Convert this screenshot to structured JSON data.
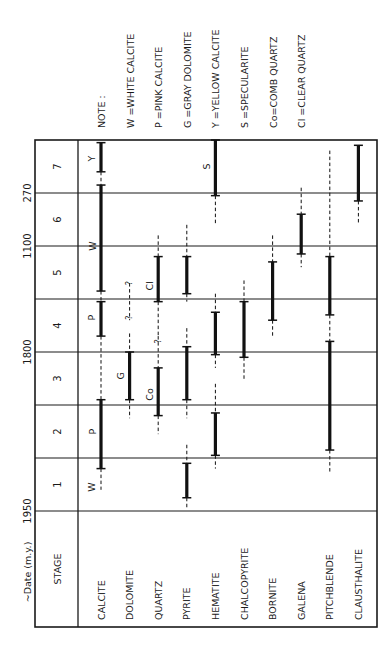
{
  "title_axis": "~Date (m.y.)",
  "stage_header": "STAGE",
  "stages": [
    "1",
    "2",
    "3",
    "4",
    "5",
    "6",
    "7"
  ],
  "date_ticks": [
    {
      "label": "1950",
      "at_stage_boundary": 0
    },
    {
      "label": "1800",
      "at_stage_boundary": 3
    },
    {
      "label": "1100",
      "at_stage_boundary": 5
    },
    {
      "label": "270",
      "at_stage_boundary": 6
    }
  ],
  "note": {
    "title": "NOTE :",
    "items": [
      "W =WHITE  CALCITE",
      "P  =PINK  CALCITE",
      "G =GRAY  DOLOMITE",
      "Y  =YELLOW CALCITE",
      "S  =SPECULARITE",
      "Co=COMB  QUARTZ",
      "Cl =CLEAR  QUARTZ"
    ]
  },
  "minerals": [
    {
      "name": "CALCITE",
      "segments": [
        {
          "type": "dashed",
          "from": 0.4,
          "to": 0.8,
          "query": true
        },
        {
          "type": "solid",
          "from": 0.8,
          "to": 2.1
        },
        {
          "type": "dashed",
          "from": 2.1,
          "to": 3.3,
          "query": true
        },
        {
          "type": "solid",
          "from": 3.3,
          "to": 3.95
        },
        {
          "type": "dashed",
          "from": 3.95,
          "to": 4.15
        },
        {
          "type": "solid",
          "from": 4.15,
          "to": 6.15
        },
        {
          "type": "dashed",
          "from": 6.15,
          "to": 6.4
        },
        {
          "type": "solid",
          "from": 6.4,
          "to": 6.95
        }
      ],
      "labels": [
        {
          "text": "W",
          "at": 0.45
        },
        {
          "text": "P",
          "at": 1.5
        },
        {
          "text": "P",
          "at": 3.65
        },
        {
          "text": "W",
          "at": 5.0
        },
        {
          "text": "Y",
          "at": 6.65
        }
      ]
    },
    {
      "name": "DOLOMITE",
      "segments": [
        {
          "type": "dashed",
          "from": 1.75,
          "to": 2.1
        },
        {
          "type": "solid",
          "from": 2.1,
          "to": 3.0
        },
        {
          "type": "dashed",
          "from": 3.0,
          "to": 3.35
        },
        {
          "type": "dashed",
          "from": 3.6,
          "to": 4.3,
          "query": true
        }
      ],
      "labels": [
        {
          "text": "G",
          "at": 2.55
        },
        {
          "text": "?",
          "at": 3.65
        },
        {
          "text": "?",
          "at": 4.3
        }
      ]
    },
    {
      "name": "QUARTZ",
      "segments": [
        {
          "type": "dashed",
          "from": 1.45,
          "to": 1.8
        },
        {
          "type": "solid",
          "from": 1.8,
          "to": 2.7
        },
        {
          "type": "dashed",
          "from": 2.7,
          "to": 3.3,
          "query": true
        },
        {
          "type": "dashed",
          "from": 3.3,
          "to": 3.95
        },
        {
          "type": "solid",
          "from": 3.95,
          "to": 4.8
        },
        {
          "type": "dashed",
          "from": 4.8,
          "to": 5.2
        }
      ],
      "labels": [
        {
          "text": "Co",
          "at": 2.2
        },
        {
          "text": "?",
          "at": 3.2
        },
        {
          "text": "Cl",
          "at": 4.25
        }
      ]
    },
    {
      "name": "PYRITE",
      "segments": [
        {
          "type": "dashed",
          "from": 0.05,
          "to": 0.25
        },
        {
          "type": "solid",
          "from": 0.25,
          "to": 0.9
        },
        {
          "type": "dashed",
          "from": 0.9,
          "to": 1.25
        },
        {
          "type": "dashed",
          "from": 1.75,
          "to": 2.1
        },
        {
          "type": "solid",
          "from": 2.1,
          "to": 3.1
        },
        {
          "type": "dashed",
          "from": 3.1,
          "to": 3.45
        },
        {
          "type": "dashed",
          "from": 3.95,
          "to": 4.1
        },
        {
          "type": "solid",
          "from": 4.1,
          "to": 4.8
        },
        {
          "type": "dashed",
          "from": 4.8,
          "to": 5.4
        }
      ],
      "labels": []
    },
    {
      "name": "HEMATITE",
      "segments": [
        {
          "type": "dashed",
          "from": 0.8,
          "to": 1.05
        },
        {
          "type": "solid",
          "from": 1.05,
          "to": 1.85
        },
        {
          "type": "dashed",
          "from": 1.85,
          "to": 2.4
        },
        {
          "type": "dashed",
          "from": 2.7,
          "to": 2.95
        },
        {
          "type": "solid",
          "from": 2.95,
          "to": 3.75
        },
        {
          "type": "dashed",
          "from": 3.75,
          "to": 4.1
        },
        {
          "type": "dashed",
          "from": 5.4,
          "to": 5.95
        },
        {
          "type": "solid",
          "from": 5.95,
          "to": 7.0
        }
      ],
      "labels": [
        {
          "text": "S",
          "at": 6.5
        }
      ]
    },
    {
      "name": "CHALCOPYRITE",
      "segments": [
        {
          "type": "dashed",
          "from": 2.45,
          "to": 2.9
        },
        {
          "type": "solid",
          "from": 2.9,
          "to": 3.95
        },
        {
          "type": "dashed",
          "from": 3.95,
          "to": 4.35
        }
      ],
      "labels": []
    },
    {
      "name": "BORNITE",
      "segments": [
        {
          "type": "dashed",
          "from": 3.3,
          "to": 3.6
        },
        {
          "type": "solid",
          "from": 3.6,
          "to": 4.7
        },
        {
          "type": "dashed",
          "from": 4.7,
          "to": 5.2
        }
      ],
      "labels": []
    },
    {
      "name": "GALENA",
      "segments": [
        {
          "type": "dashed",
          "from": 4.6,
          "to": 4.85
        },
        {
          "type": "solid",
          "from": 4.85,
          "to": 5.6
        },
        {
          "type": "dashed",
          "from": 5.6,
          "to": 6.1
        }
      ],
      "labels": []
    },
    {
      "name": "PITCHBLENDE",
      "segments": [
        {
          "type": "dashed",
          "from": 0.7,
          "to": 1.15
        },
        {
          "type": "solid",
          "from": 1.15,
          "to": 3.2
        },
        {
          "type": "dashed",
          "from": 3.2,
          "to": 3.7
        },
        {
          "type": "solid",
          "from": 3.7,
          "to": 4.8
        },
        {
          "type": "dashed",
          "from": 4.8,
          "to": 6.8
        }
      ],
      "labels": []
    },
    {
      "name": "CLAUSTHALITE",
      "segments": [
        {
          "type": "dashed",
          "from": 5.4,
          "to": 5.85
        },
        {
          "type": "solid",
          "from": 5.85,
          "to": 6.9
        }
      ],
      "labels": []
    }
  ]
}
